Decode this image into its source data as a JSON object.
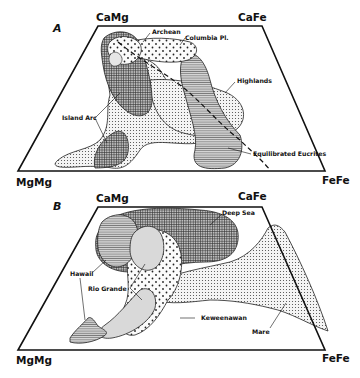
{
  "figure": {
    "panels": [
      {
        "id": "A",
        "corners": {
          "top_left": "CaMg",
          "top_right": "CaFe",
          "bottom_left": "MgMg",
          "bottom_right": "FeFe"
        },
        "regions": [
          {
            "label": "Archean",
            "pattern": "dots"
          },
          {
            "label": "Columbia Pl.",
            "pattern": "horizontal-lines"
          },
          {
            "label": "Highlands",
            "pattern": "fine-dots"
          },
          {
            "label": "Island Arc",
            "pattern": "fine-dots / crosshatch"
          },
          {
            "label": "Equilibrated Eucrites",
            "pattern": "horizontal-lines"
          }
        ]
      },
      {
        "id": "B",
        "corners": {
          "top_left": "CaMg",
          "top_right": "CaFe",
          "bottom_left": "MgMg",
          "bottom_right": "FeFe"
        },
        "regions": [
          {
            "label": "Deep Sea",
            "pattern": "crosshatch"
          },
          {
            "label": "Hawaii",
            "pattern": "horizontal-lines"
          },
          {
            "label": "Rio Grande",
            "pattern": "light-gray"
          },
          {
            "label": "Keweenawan",
            "pattern": "dots"
          },
          {
            "label": "Mare",
            "pattern": "fine-dots"
          }
        ]
      }
    ]
  },
  "panelA": {
    "label": "A",
    "corner_tl": "CaMg",
    "corner_tr": "CaFe",
    "corner_bl": "MgMg",
    "corner_br": "FeFe",
    "archean": "Archean",
    "columbia": "Columbia Pl.",
    "highlands": "Highlands",
    "island_arc": "Island Arc",
    "eucrites": "Equilibrated Eucrites"
  },
  "panelB": {
    "label": "B",
    "corner_tl": "CaMg",
    "corner_tr": "CaFe",
    "corner_bl": "MgMg",
    "corner_br": "FeFe",
    "deep_sea": "Deep Sea",
    "hawaii": "Hawaii",
    "rio_grande": "Rio Grande",
    "keweenawan": "Keweenawan",
    "mare": "Mare"
  }
}
